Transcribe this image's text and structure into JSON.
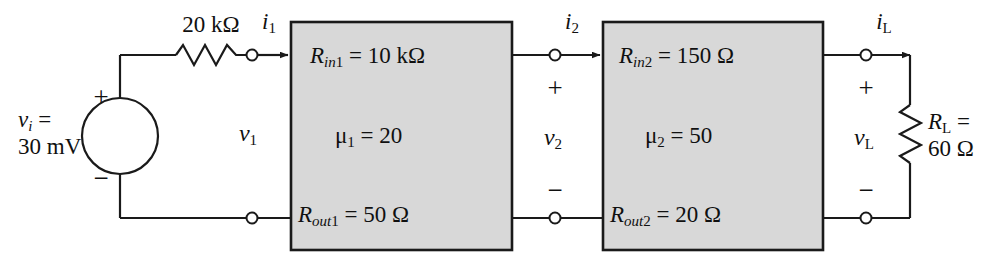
{
  "diagram": {
    "type": "circuit-schematic",
    "colors": {
      "block_fill": "#d8d8d8",
      "block_stroke": "#1a1a1a",
      "wire": "#1a1a1a",
      "text": "#101010",
      "background": "#ffffff"
    }
  },
  "source": {
    "name": "independent-voltage-source",
    "label_line1": "v",
    "label_line1_sub": "i",
    "label_line1_eq": " =",
    "label_line2": "30 mV",
    "plus": "+",
    "minus": "−"
  },
  "series_resistor": {
    "name": "series-resistor-20k",
    "value": "20 kΩ"
  },
  "port1": {
    "current_symbol": "i",
    "current_sub": "1",
    "voltage_symbol": "v",
    "voltage_sub": "1"
  },
  "block1": {
    "name": "amplifier-stage-1",
    "rin_symbol": "R",
    "rin_sub": "in",
    "rin_idx": "1",
    "rin_value": " = 10 kΩ",
    "mu_symbol": "μ",
    "mu_sub": "1",
    "mu_value": " = 20",
    "rout_symbol": "R",
    "rout_sub": "out",
    "rout_idx": "1",
    "rout_value": " = 50 Ω"
  },
  "port2": {
    "current_symbol": "i",
    "current_sub": "2",
    "plus": "+",
    "minus": "−",
    "voltage_symbol": "v",
    "voltage_sub": "2"
  },
  "block2": {
    "name": "amplifier-stage-2",
    "rin_symbol": "R",
    "rin_sub": "in",
    "rin_idx": "2",
    "rin_value": " = 150 Ω",
    "mu_symbol": "μ",
    "mu_sub": "2",
    "mu_value": " = 50",
    "rout_symbol": "R",
    "rout_sub": "out",
    "rout_idx": "2",
    "rout_value": " = 20 Ω"
  },
  "port_load": {
    "current_symbol": "i",
    "current_sub": "L",
    "plus": "+",
    "minus": "−",
    "voltage_symbol": "v",
    "voltage_sub": "L"
  },
  "load": {
    "name": "load-resistor",
    "symbol": "R",
    "sub": "L",
    "eq": " =",
    "value": "60 Ω"
  }
}
